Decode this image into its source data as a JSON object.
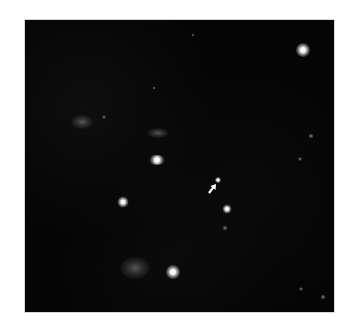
{
  "image": {
    "description": "Astronomical star field (grayscale) with an arrow marking a faint object",
    "frame": {
      "x": 25,
      "y": 20,
      "width": 309,
      "height": 292,
      "background": "#050505"
    }
  },
  "objects": [
    {
      "id": "star-top-right",
      "type": "star",
      "x": 303,
      "y": 50,
      "size": 14
    },
    {
      "id": "star-center-elongated",
      "type": "star",
      "x": 157,
      "y": 160,
      "size": 10,
      "elongation": 1.6
    },
    {
      "id": "star-left",
      "type": "star",
      "x": 123,
      "y": 202,
      "size": 11
    },
    {
      "id": "star-target",
      "type": "star",
      "x": 218,
      "y": 180,
      "size": 6
    },
    {
      "id": "star-right-center",
      "type": "star",
      "x": 227,
      "y": 209,
      "size": 9
    },
    {
      "id": "star-bottom",
      "type": "star",
      "x": 173,
      "y": 272,
      "size": 14
    },
    {
      "id": "galaxy-bottom",
      "type": "diffuse",
      "x": 135,
      "y": 268,
      "w": 30,
      "h": 22
    },
    {
      "id": "nebula-left",
      "type": "diffuse",
      "x": 82,
      "y": 122,
      "w": 22,
      "h": 14
    },
    {
      "id": "nebula-center",
      "type": "diffuse",
      "x": 158,
      "y": 133,
      "w": 22,
      "h": 10
    },
    {
      "id": "faint-1",
      "type": "faint",
      "x": 104,
      "y": 117,
      "size": 4
    },
    {
      "id": "faint-2",
      "type": "faint",
      "x": 311,
      "y": 136,
      "size": 5
    },
    {
      "id": "faint-3",
      "type": "faint",
      "x": 300,
      "y": 159,
      "size": 4
    },
    {
      "id": "faint-4",
      "type": "faint",
      "x": 193,
      "y": 35,
      "size": 3
    },
    {
      "id": "faint-5",
      "type": "faint",
      "x": 154,
      "y": 88,
      "size": 3
    },
    {
      "id": "faint-6",
      "type": "faint",
      "x": 225,
      "y": 228,
      "size": 5
    },
    {
      "id": "faint-7",
      "type": "faint",
      "x": 301,
      "y": 289,
      "size": 4
    },
    {
      "id": "faint-8",
      "type": "faint",
      "x": 323,
      "y": 297,
      "size": 5
    }
  ],
  "arrow": {
    "tip": {
      "x": 216,
      "y": 184
    },
    "tail": {
      "x": 209,
      "y": 193
    },
    "color": "#ffffff",
    "points_to": "star-target"
  }
}
